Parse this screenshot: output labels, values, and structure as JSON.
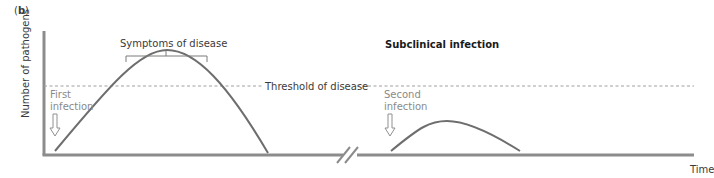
{
  "panel_label_open": "(",
  "panel_label_letter": "b",
  "panel_label_close": ")",
  "y_axis_label": "Number of pathogens",
  "x_axis_label": "Time",
  "threshold_label": "Threshold of disease",
  "symptoms_label": "Symptoms of disease",
  "subclinical_label": "Subclinical infection",
  "first_infection": [
    "First",
    "infection"
  ],
  "second_infection": [
    "Second",
    "infection"
  ],
  "colors": {
    "axis": "#8c8c8c",
    "curve": "#6e6e6e",
    "threshold": "#a0a0a0",
    "arrow": "#909090",
    "text": "#3a3a3a"
  }
}
